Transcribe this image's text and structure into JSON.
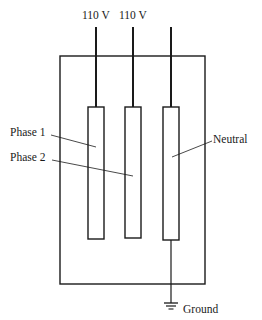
{
  "diagram": {
    "type": "electrical-schematic",
    "supply_labels": [
      "110 V",
      "110 V"
    ],
    "conductors": [
      {
        "id": "phase1",
        "label": "Phase 1"
      },
      {
        "id": "phase2",
        "label": "Phase 2"
      },
      {
        "id": "neutral",
        "label": "Neutral"
      }
    ],
    "ground_label": "Ground",
    "colors": {
      "ink": "#1a1a1a",
      "background": "#ffffff"
    }
  }
}
